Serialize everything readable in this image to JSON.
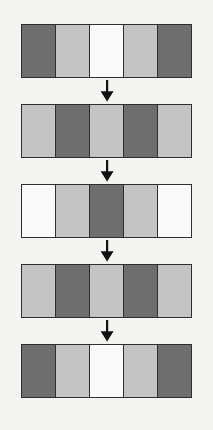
{
  "figure": {
    "background_color": "#f4f4f2",
    "palette": {
      "dark": "#6e6e6e",
      "light": "#c4c4c4",
      "white": "#fafafa",
      "border": "#2e2e2e",
      "arrow": "#111111"
    },
    "cells_per_row": 5,
    "row_count": 5,
    "arrow_count": 4,
    "arrow_glyph": "down-arrow",
    "rows": [
      {
        "index": 1,
        "step_label": "Step 1",
        "cells": [
          {
            "tone": "dark",
            "color": "#6e6e6e"
          },
          {
            "tone": "light",
            "color": "#c4c4c4"
          },
          {
            "tone": "white",
            "color": "#fafafa"
          },
          {
            "tone": "light",
            "color": "#c4c4c4"
          },
          {
            "tone": "dark",
            "color": "#6e6e6e"
          }
        ]
      },
      {
        "index": 2,
        "step_label": "Step 2",
        "cells": [
          {
            "tone": "light",
            "color": "#c4c4c4"
          },
          {
            "tone": "dark",
            "color": "#6e6e6e"
          },
          {
            "tone": "light",
            "color": "#c4c4c4"
          },
          {
            "tone": "dark",
            "color": "#6e6e6e"
          },
          {
            "tone": "light",
            "color": "#c4c4c4"
          }
        ]
      },
      {
        "index": 3,
        "step_label": "Step 3",
        "cells": [
          {
            "tone": "white",
            "color": "#fafafa"
          },
          {
            "tone": "light",
            "color": "#c4c4c4"
          },
          {
            "tone": "dark",
            "color": "#6e6e6e"
          },
          {
            "tone": "light",
            "color": "#c4c4c4"
          },
          {
            "tone": "white",
            "color": "#fafafa"
          }
        ]
      },
      {
        "index": 4,
        "step_label": "Step 4",
        "cells": [
          {
            "tone": "light",
            "color": "#c4c4c4"
          },
          {
            "tone": "dark",
            "color": "#6e6e6e"
          },
          {
            "tone": "light",
            "color": "#c4c4c4"
          },
          {
            "tone": "dark",
            "color": "#6e6e6e"
          },
          {
            "tone": "light",
            "color": "#c4c4c4"
          }
        ]
      },
      {
        "index": 5,
        "step_label": "Step 5",
        "cells": [
          {
            "tone": "dark",
            "color": "#6e6e6e"
          },
          {
            "tone": "light",
            "color": "#c4c4c4"
          },
          {
            "tone": "white",
            "color": "#fafafa"
          },
          {
            "tone": "light",
            "color": "#c4c4c4"
          },
          {
            "tone": "dark",
            "color": "#6e6e6e"
          }
        ]
      }
    ],
    "geometry": {
      "strip_left": 21,
      "strip_width": 171,
      "strip_height": 54,
      "row_tops": [
        24,
        104,
        184,
        264,
        344
      ],
      "arrow_tops": [
        78,
        158,
        238,
        318
      ]
    }
  }
}
